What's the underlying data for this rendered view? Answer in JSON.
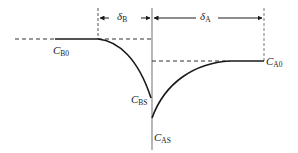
{
  "diagram": {
    "type": "concentration-profile",
    "labels": {
      "delta_b": {
        "symbol": "δ",
        "sub": "B"
      },
      "delta_a": {
        "symbol": "δ",
        "sub": "A"
      },
      "c_b0": {
        "symbol": "C",
        "sub": "B0"
      },
      "c_bs": {
        "symbol": "C",
        "sub": "BS"
      },
      "c_as": {
        "symbol": "C",
        "sub": "AS"
      },
      "c_a0": {
        "symbol": "C",
        "sub": "A0"
      }
    },
    "colors": {
      "line": "#1a1a1a",
      "dashed": "#333333",
      "interface": "#888888"
    }
  }
}
